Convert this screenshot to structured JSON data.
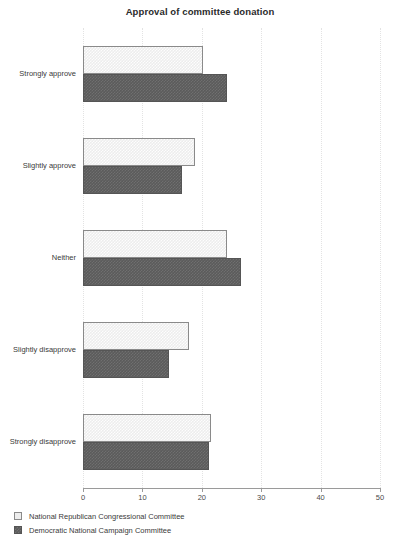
{
  "chart_data": {
    "type": "bar",
    "orientation": "horizontal",
    "title": "Approval of committee donation",
    "xlabel": "",
    "ylabel": "",
    "xlim": [
      0,
      50
    ],
    "xticks": [
      0,
      10,
      20,
      30,
      40,
      50
    ],
    "xtick_labels": [
      "0",
      "10",
      "20",
      "30",
      "40",
      "50"
    ],
    "grid": true,
    "grid_axis": "x",
    "legend_position": "bottom-left",
    "categories": [
      "Strongly approve",
      "Slightly approve",
      "Neither",
      "Slightly disapprove",
      "Strongly disapprove"
    ],
    "series": [
      {
        "name": "National Republican Congressional Committee",
        "color": "#ededed",
        "edge_color": "#8a8a8a",
        "values": [
          20.2,
          18.8,
          24.2,
          17.8,
          21.5
        ]
      },
      {
        "name": "Democratic National Campaign Committee",
        "color": "#5b5b5b",
        "edge_color": "#555555",
        "values": [
          24.2,
          16.6,
          26.6,
          14.5,
          21.2
        ]
      }
    ]
  },
  "legend": {
    "items": [
      {
        "label": "National Republican Congressional Committee"
      },
      {
        "label": "Democratic National Campaign Committee"
      }
    ]
  },
  "colors": {
    "background": "#ffffff",
    "axis": "#9a9a9a",
    "grid": "#e3e3e3",
    "text": "#333333"
  }
}
